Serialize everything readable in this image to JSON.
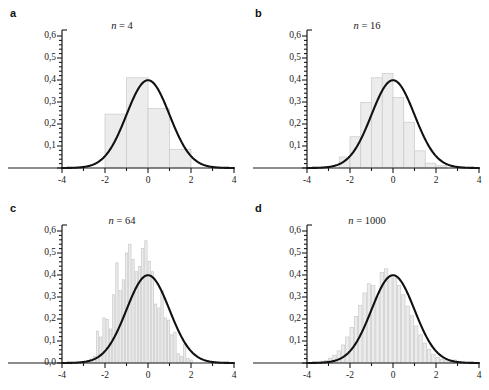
{
  "figure": {
    "caption_style": "decimal-comma",
    "axis_color": "#1a1a1a",
    "curve_color": "#111111",
    "bar_fill": "#ececec",
    "bar_stroke": "#c9c9c9"
  },
  "panels": [
    {
      "letter": "a",
      "title_var": "n",
      "title_eq": " = 4",
      "x": {
        "min": -4,
        "max": 4,
        "labels": [
          "-4",
          "-2",
          "0",
          "2",
          "4"
        ],
        "label_values": [
          -4,
          -2,
          0,
          2,
          4
        ],
        "minor_step": 1
      },
      "y": {
        "min": 0,
        "max": 0.6,
        "labels": [
          "0,1",
          "0,2",
          "0,3",
          "0,4",
          "0,5",
          "0,6"
        ],
        "label_values": [
          0.1,
          0.2,
          0.3,
          0.4,
          0.5,
          0.6
        ],
        "minor_count": 4,
        "show_zero": false
      },
      "bins": {
        "width": 1.0,
        "edges": [
          -2,
          -1,
          0,
          1,
          2
        ],
        "values": [
          0.245,
          0.41,
          0.27,
          0.085
        ]
      },
      "curve": {
        "type": "normal",
        "mean": 0,
        "sd": 1,
        "peak": 0.399
      }
    },
    {
      "letter": "b",
      "title_var": "n",
      "title_eq": " = 16",
      "x": {
        "min": -4,
        "max": 4,
        "labels": [
          "-4",
          "-2",
          "0",
          "2",
          "4"
        ],
        "label_values": [
          -4,
          -2,
          0,
          2,
          4
        ],
        "minor_step": 1
      },
      "y": {
        "min": 0,
        "max": 0.6,
        "labels": [
          "0,1",
          "0,2",
          "0,3",
          "0,4",
          "0,5",
          "0,6"
        ],
        "label_values": [
          0.1,
          0.2,
          0.3,
          0.4,
          0.5,
          0.6
        ],
        "minor_count": 4,
        "show_zero": false
      },
      "bins": {
        "width": 0.5,
        "edges": [
          -2.5,
          -2,
          -1.5,
          -1,
          -0.5,
          0,
          0.5,
          1,
          1.5,
          2,
          2.5
        ],
        "values": [
          0.05,
          0.142,
          0.298,
          0.41,
          0.43,
          0.32,
          0.208,
          0.078,
          0.022,
          0.01
        ]
      },
      "curve": {
        "type": "normal",
        "mean": 0,
        "sd": 1,
        "peak": 0.399
      }
    },
    {
      "letter": "c",
      "title_var": "n",
      "title_eq": " = 64",
      "x": {
        "min": -4,
        "max": 4,
        "labels": [
          "-4",
          "-2",
          "0",
          "2",
          "4"
        ],
        "label_values": [
          -4,
          -2,
          0,
          2,
          4
        ],
        "minor_step": 1
      },
      "y": {
        "min": 0,
        "max": 0.6,
        "labels": [
          "0,0",
          "0,1",
          "0,2",
          "0,3",
          "0,4",
          "0,5",
          "0,6"
        ],
        "label_values": [
          0.0,
          0.1,
          0.2,
          0.3,
          0.4,
          0.5,
          0.6
        ],
        "minor_count": 4,
        "show_zero": true
      },
      "bins": {
        "width": 0.15,
        "start": -2.85,
        "values": [
          0.012,
          0.018,
          0.03,
          0.145,
          0.118,
          0.205,
          0.198,
          0.155,
          0.31,
          0.455,
          0.33,
          0.378,
          0.5,
          0.54,
          0.47,
          0.415,
          0.438,
          0.52,
          0.556,
          0.462,
          0.415,
          0.268,
          0.25,
          0.33,
          0.205,
          0.195,
          0.128,
          0.14,
          0.042,
          0.03,
          0.086,
          0.02,
          0.014
        ]
      },
      "curve": {
        "type": "normal",
        "mean": 0,
        "sd": 1,
        "peak": 0.399
      }
    },
    {
      "letter": "d",
      "title_var": "n",
      "title_eq": " = 1000",
      "x": {
        "min": -4,
        "max": 4,
        "labels": [
          "-4",
          "-2",
          "0",
          "2",
          "4"
        ],
        "label_values": [
          -4,
          -2,
          0,
          2,
          4
        ],
        "minor_step": 1
      },
      "y": {
        "min": 0,
        "max": 0.6,
        "labels": [
          "0,1",
          "0,2",
          "0,3",
          "0,4",
          "0,5",
          "0,6"
        ],
        "label_values": [
          0.1,
          0.2,
          0.3,
          0.4,
          0.5,
          0.6
        ],
        "minor_count": 4,
        "show_zero": false
      },
      "bins": {
        "width": 0.2,
        "start": -3.4,
        "values": [
          0.008,
          0.012,
          0.022,
          0.035,
          0.055,
          0.082,
          0.118,
          0.162,
          0.212,
          0.262,
          0.318,
          0.36,
          0.352,
          0.3,
          0.412,
          0.428,
          0.392,
          0.386,
          0.352,
          0.31,
          0.258,
          0.215,
          0.168,
          0.128,
          0.09,
          0.062,
          0.04,
          0.026,
          0.016,
          0.01,
          0.006,
          0.014,
          0.004
        ]
      },
      "curve": {
        "type": "normal",
        "mean": 0,
        "sd": 1,
        "peak": 0.399
      }
    }
  ],
  "chart_data": {
    "type": "bar",
    "xlabel": "",
    "ylabel": "",
    "xlim": [
      -4,
      4
    ],
    "ylim": [
      0,
      0.6
    ],
    "grid": false,
    "legend": "none",
    "panel_count": 4,
    "panels": [
      {
        "panel": "a",
        "title": "n = 4",
        "n": 4,
        "bin_width": 1.0,
        "bin_edges": [
          -2,
          -1,
          0,
          1,
          2
        ],
        "bin_centers": [
          -1.5,
          -0.5,
          0.5,
          1.5
        ],
        "values": [
          0.245,
          0.41,
          0.27,
          0.085
        ],
        "overlay_curve": {
          "type": "normal",
          "mean": 0,
          "sd": 1,
          "peak": 0.399
        },
        "xticks": [
          -4,
          -2,
          0,
          2,
          4
        ],
        "yticks": [
          0.1,
          0.2,
          0.3,
          0.4,
          0.5,
          0.6
        ],
        "ytick_labels": [
          "0,1",
          "0,2",
          "0,3",
          "0,4",
          "0,5",
          "0,6"
        ]
      },
      {
        "panel": "b",
        "title": "n = 16",
        "n": 16,
        "bin_width": 0.5,
        "bin_edges": [
          -2.5,
          -2,
          -1.5,
          -1,
          -0.5,
          0,
          0.5,
          1,
          1.5,
          2,
          2.5
        ],
        "bin_centers": [
          -2.25,
          -1.75,
          -1.25,
          -0.75,
          -0.25,
          0.25,
          0.75,
          1.25,
          1.75,
          2.25
        ],
        "values": [
          0.05,
          0.142,
          0.298,
          0.41,
          0.43,
          0.32,
          0.208,
          0.078,
          0.022,
          0.01
        ],
        "overlay_curve": {
          "type": "normal",
          "mean": 0,
          "sd": 1,
          "peak": 0.399
        },
        "xticks": [
          -4,
          -2,
          0,
          2,
          4
        ],
        "yticks": [
          0.1,
          0.2,
          0.3,
          0.4,
          0.5,
          0.6
        ],
        "ytick_labels": [
          "0,1",
          "0,2",
          "0,3",
          "0,4",
          "0,5",
          "0,6"
        ]
      },
      {
        "panel": "c",
        "title": "n = 64",
        "n": 64,
        "bin_width": 0.15,
        "bin_start": -2.85,
        "values": [
          0.012,
          0.018,
          0.03,
          0.145,
          0.118,
          0.205,
          0.198,
          0.155,
          0.31,
          0.455,
          0.33,
          0.378,
          0.5,
          0.54,
          0.47,
          0.415,
          0.438,
          0.52,
          0.556,
          0.462,
          0.415,
          0.268,
          0.25,
          0.33,
          0.205,
          0.195,
          0.128,
          0.14,
          0.042,
          0.03,
          0.086,
          0.02,
          0.014
        ],
        "overlay_curve": {
          "type": "normal",
          "mean": 0,
          "sd": 1,
          "peak": 0.399
        },
        "xticks": [
          -4,
          -2,
          0,
          2,
          4
        ],
        "yticks": [
          0.0,
          0.1,
          0.2,
          0.3,
          0.4,
          0.5,
          0.6
        ],
        "ytick_labels": [
          "0,0",
          "0,1",
          "0,2",
          "0,3",
          "0,4",
          "0,5",
          "0,6"
        ]
      },
      {
        "panel": "d",
        "title": "n = 1000",
        "n": 1000,
        "bin_width": 0.2,
        "bin_start": -3.4,
        "values": [
          0.008,
          0.012,
          0.022,
          0.035,
          0.055,
          0.082,
          0.118,
          0.162,
          0.212,
          0.262,
          0.318,
          0.36,
          0.352,
          0.3,
          0.412,
          0.428,
          0.392,
          0.386,
          0.352,
          0.31,
          0.258,
          0.215,
          0.168,
          0.128,
          0.09,
          0.062,
          0.04,
          0.026,
          0.016,
          0.01,
          0.006,
          0.014,
          0.004
        ],
        "overlay_curve": {
          "type": "normal",
          "mean": 0,
          "sd": 1,
          "peak": 0.399
        },
        "xticks": [
          -4,
          -2,
          0,
          2,
          4
        ],
        "yticks": [
          0.1,
          0.2,
          0.3,
          0.4,
          0.5,
          0.6
        ],
        "ytick_labels": [
          "0,1",
          "0,2",
          "0,3",
          "0,4",
          "0,5",
          "0,6"
        ]
      }
    ]
  }
}
